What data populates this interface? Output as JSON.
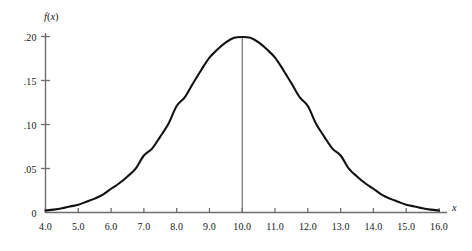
{
  "chart_data": {
    "type": "line",
    "title": "",
    "subtitle": "",
    "xlabel": "x",
    "ylabel": "f(x)",
    "xlim": [
      4.0,
      16.0
    ],
    "ylim": [
      0,
      0.21
    ],
    "grid": false,
    "legend": null,
    "distribution": {
      "name": "normal",
      "mean": 10.0,
      "std_dev": 2.0,
      "peak_value": 0.199
    },
    "annotations": [
      {
        "type": "vertical-line",
        "x": 10.0,
        "y_from": 0,
        "y_to": 0.199,
        "label": ""
      }
    ],
    "x_ticks": [
      4.0,
      5.0,
      6.0,
      7.0,
      8.0,
      9.0,
      10.0,
      11.0,
      12.0,
      13.0,
      14.0,
      15.0,
      16.0
    ],
    "x_tick_labels": [
      "4.0",
      "5.0",
      "6.0",
      "7.0",
      "8.0",
      "9.0",
      "10.0",
      "11.0",
      "12.0",
      "13.0",
      "14.0",
      "15.0",
      "16.0"
    ],
    "y_ticks": [
      0,
      0.05,
      0.1,
      0.15,
      0.2
    ],
    "y_tick_labels": [
      "0",
      ".05",
      ".10",
      ".15",
      ".20"
    ],
    "x": [
      4.0,
      4.25,
      4.5,
      4.75,
      5.0,
      5.25,
      5.5,
      5.75,
      6.0,
      6.25,
      6.5,
      6.75,
      7.0,
      7.25,
      7.5,
      7.75,
      8.0,
      8.25,
      8.5,
      8.75,
      9.0,
      9.25,
      9.5,
      9.75,
      10.0,
      10.25,
      10.5,
      10.75,
      11.0,
      11.25,
      11.5,
      11.75,
      12.0,
      12.25,
      12.5,
      12.75,
      13.0,
      13.25,
      13.5,
      13.75,
      14.0,
      14.25,
      14.5,
      14.75,
      15.0,
      15.25,
      15.5,
      15.75,
      16.0
    ],
    "y": [
      0.0022,
      0.0033,
      0.0048,
      0.0069,
      0.0088,
      0.0122,
      0.0158,
      0.0203,
      0.027,
      0.0332,
      0.041,
      0.0499,
      0.0648,
      0.0726,
      0.0863,
      0.1009,
      0.121,
      0.131,
      0.1468,
      0.162,
      0.176,
      0.1854,
      0.1933,
      0.1985,
      0.1995,
      0.1985,
      0.1933,
      0.1854,
      0.176,
      0.162,
      0.1468,
      0.131,
      0.121,
      0.1009,
      0.0863,
      0.0726,
      0.0648,
      0.0499,
      0.041,
      0.0332,
      0.027,
      0.0203,
      0.0158,
      0.0122,
      0.0088,
      0.0069,
      0.0048,
      0.0033,
      0.0022
    ],
    "colors": {
      "curve": "#111111",
      "axis": "#6e6e6e",
      "mean_line": "#6e6e6e",
      "background": "#ffffff",
      "text": "#161616"
    }
  }
}
